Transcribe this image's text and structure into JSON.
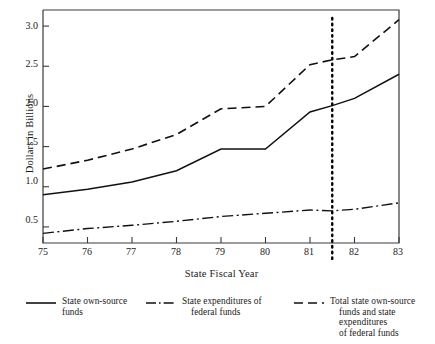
{
  "chart_data": {
    "type": "line",
    "title": "",
    "xlabel": "State Fiscal Year",
    "ylabel": "Dollars in Billions",
    "xlim": [
      75,
      83
    ],
    "ylim": [
      0.3,
      3.2
    ],
    "xticks": [
      "75",
      "76",
      "77",
      "78",
      "79",
      "80",
      "81",
      "82",
      "83"
    ],
    "yticks": [
      "0.5",
      "1.0",
      "1.5",
      "2.0",
      "2.5",
      "3.0"
    ],
    "grid": false,
    "legend_position": "below",
    "x": [
      75,
      76,
      77,
      78,
      79,
      80,
      81,
      81.5,
      82,
      83
    ],
    "series": [
      {
        "name": "State own-source funds",
        "style": "solid",
        "values": [
          0.9,
          0.97,
          1.06,
          1.2,
          1.47,
          1.47,
          1.93,
          2.01,
          2.1,
          2.4
        ]
      },
      {
        "name": "State expenditures of federal funds",
        "style": "dash-dot",
        "values": [
          0.42,
          0.48,
          0.52,
          0.57,
          0.63,
          0.67,
          0.71,
          0.7,
          0.72,
          0.8
        ]
      },
      {
        "name": "Total state own-source funds and state expenditures of federal funds",
        "style": "dashed",
        "values": [
          1.22,
          1.33,
          1.47,
          1.65,
          1.97,
          2.0,
          2.52,
          2.58,
          2.62,
          3.08
        ]
      }
    ],
    "annotations": [
      {
        "type": "vertical-dotted-line",
        "x": 81.5
      }
    ]
  },
  "axis": {
    "y_title": "Dollars in Billions",
    "x_title": "State Fiscal Year",
    "y_ticks": [
      {
        "label": "3.0",
        "value": 3.0
      },
      {
        "label": "2.5",
        "value": 2.5
      },
      {
        "label": "2.0",
        "value": 2.0
      },
      {
        "label": "1.5",
        "value": 1.5
      },
      {
        "label": "1.0",
        "value": 1.0
      },
      {
        "label": "0.5",
        "value": 0.5
      }
    ],
    "x_ticks": [
      {
        "label": "75"
      },
      {
        "label": "76"
      },
      {
        "label": "77"
      },
      {
        "label": "78"
      },
      {
        "label": "79"
      },
      {
        "label": "80"
      },
      {
        "label": "81"
      },
      {
        "label": "82"
      },
      {
        "label": "83"
      }
    ]
  },
  "legend": {
    "items": [
      {
        "style": "solid",
        "line1": "State own-source",
        "line2": "funds",
        "line3": ""
      },
      {
        "style": "dash-dot",
        "line1": "State expenditures of",
        "line2": "federal funds",
        "line3": ""
      },
      {
        "style": "dashed",
        "line1": "Total state own-source",
        "line2": "funds and state expenditures",
        "line3": "of federal funds"
      }
    ]
  },
  "colors": {
    "ink": "#1a1a1a",
    "background": "#ffffff"
  }
}
